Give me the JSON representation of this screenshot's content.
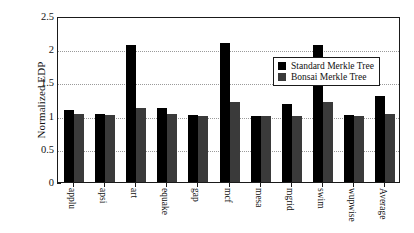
{
  "chart_data": {
    "type": "bar",
    "title": "",
    "xlabel": "",
    "ylabel": "Normalized EDP",
    "ylim": [
      0,
      2.5
    ],
    "yticks": [
      "0",
      "0.5",
      "1",
      "1.5",
      "2",
      "2.5"
    ],
    "ytick_values": [
      0,
      0.5,
      1,
      1.5,
      2,
      2.5
    ],
    "grid": true,
    "grid_axis": "y",
    "legend_position": "upper-right-inside",
    "categories": [
      "applu",
      "apsi",
      "art",
      "equake",
      "gap",
      "mcf",
      "mesa",
      "mgrid",
      "swim",
      "wupwise",
      "Average"
    ],
    "series": [
      {
        "name": "Standard Merkle Tree",
        "color": "#000000",
        "values": [
          1.08,
          1.03,
          2.06,
          1.11,
          1.01,
          2.09,
          1.0,
          1.17,
          2.07,
          1.01,
          1.29
        ]
      },
      {
        "name": "Bonsai Merkle Tree",
        "color": "#3a3a3a",
        "values": [
          1.02,
          1.01,
          1.11,
          1.02,
          1.0,
          1.2,
          0.99,
          1.0,
          1.21,
          0.99,
          1.02
        ]
      }
    ]
  },
  "legend": {
    "items": [
      {
        "label": "Standard Merkle Tree"
      },
      {
        "label": "Bonsai Merkle Tree"
      }
    ]
  }
}
